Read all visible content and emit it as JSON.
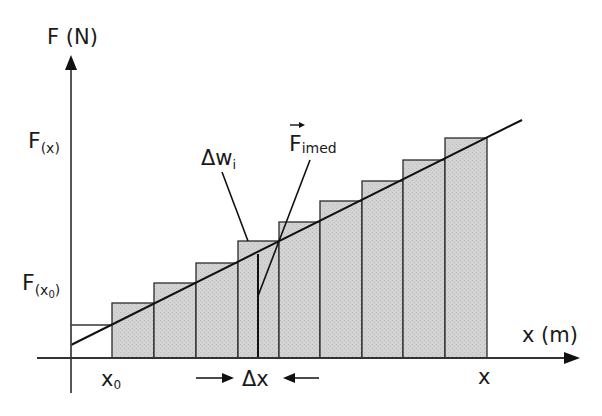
{
  "diagram": {
    "type": "work-area-under-force-graph",
    "axes": {
      "y_label": "F (N)",
      "x_label": "x (m)"
    },
    "labels": {
      "F_x": "F",
      "F_x_sub": "(x)",
      "F_x0": "F",
      "F_x0_sub_open": "(x",
      "F_x0_sub_0": "0",
      "F_x0_sub_close": ")",
      "x0": "x",
      "x0_sub": "0",
      "x_end": "x",
      "delta_w": "Δw",
      "delta_w_sub": "i",
      "F_imed": "F",
      "F_imed_sub": "imed",
      "delta_x": "Δx"
    },
    "colors": {
      "bar_fill": "#cfcfcf",
      "line": "#1a1a1a",
      "axis": "#333333"
    },
    "bars": [
      {
        "x0": 112,
        "x1": 154,
        "top": 303
      },
      {
        "x0": 154,
        "x1": 196,
        "top": 283
      },
      {
        "x0": 196,
        "x1": 238,
        "top": 263
      },
      {
        "x0": 238,
        "x1": 279,
        "top": 241
      },
      {
        "x0": 279,
        "x1": 320,
        "top": 222
      },
      {
        "x0": 320,
        "x1": 362,
        "top": 201
      },
      {
        "x0": 362,
        "x1": 403,
        "top": 181
      },
      {
        "x0": 403,
        "x1": 445,
        "top": 160
      },
      {
        "x0": 445,
        "x1": 487,
        "top": 138
      }
    ],
    "bar_count": 9
  }
}
